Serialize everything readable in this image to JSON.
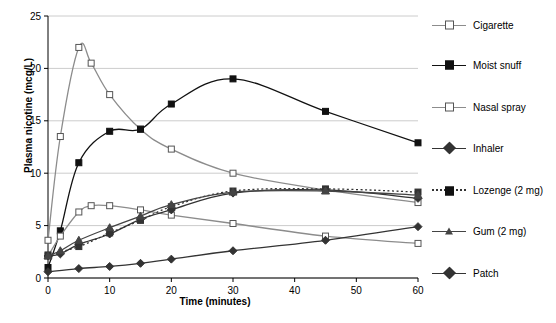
{
  "chart_data": {
    "type": "line",
    "title": "",
    "xlabel": "Time (minutes)",
    "ylabel": "Plasma nicotine (mcg/L)",
    "xlim": [
      0,
      60
    ],
    "ylim": [
      0,
      25
    ],
    "xticks": [
      0,
      10,
      20,
      30,
      40,
      50,
      60
    ],
    "yticks": [
      0,
      5,
      10,
      15,
      20,
      25
    ],
    "grid": true,
    "legend_position": "right",
    "series": [
      {
        "name": "Cigarette",
        "marker": "open-square",
        "color": "#8c8c8c",
        "x": [
          0,
          2,
          5,
          7,
          10,
          15,
          20,
          30,
          45,
          60
        ],
        "y": [
          3.6,
          13.5,
          22.0,
          20.5,
          17.5,
          14.2,
          12.3,
          10.0,
          8.4,
          7.2
        ]
      },
      {
        "name": "Moist snuff",
        "marker": "filled-square",
        "color": "#111111",
        "x": [
          0,
          2,
          5,
          10,
          15,
          20,
          30,
          45,
          60
        ],
        "y": [
          1.0,
          4.5,
          11.0,
          14.0,
          14.2,
          16.6,
          19.0,
          15.9,
          12.9
        ]
      },
      {
        "name": "Nasal spray",
        "marker": "open-square",
        "color": "#8c8c8c",
        "x": [
          0,
          2,
          5,
          7,
          10,
          15,
          20,
          30,
          45,
          60
        ],
        "y": [
          2.1,
          4.0,
          6.3,
          6.9,
          6.9,
          6.5,
          6.0,
          5.2,
          4.0,
          3.3
        ]
      },
      {
        "name": "Inhaler",
        "marker": "filled-diamond",
        "color": "#333333",
        "x": [
          0,
          2,
          5,
          10,
          15,
          20,
          30,
          45,
          60
        ],
        "y": [
          2.1,
          2.3,
          3.2,
          4.2,
          5.6,
          6.5,
          8.1,
          8.4,
          7.6
        ]
      },
      {
        "name": "Lozenge (2 mg)",
        "marker": "filled-square",
        "line_style": "dotted",
        "color": "#333333",
        "x": [
          0,
          5,
          10,
          15,
          20,
          30,
          45,
          60
        ],
        "y": [
          2.2,
          3.0,
          4.3,
          5.5,
          6.8,
          8.3,
          8.5,
          8.2
        ]
      },
      {
        "name": "Gum (2 mg)",
        "marker": "filled-triangle",
        "color": "#444444",
        "x": [
          0,
          2,
          5,
          10,
          15,
          20,
          30,
          45,
          60
        ],
        "y": [
          2.1,
          2.6,
          3.6,
          4.8,
          5.9,
          7.0,
          8.2,
          8.3,
          7.9
        ]
      },
      {
        "name": "Patch",
        "marker": "filled-diamond",
        "color": "#333333",
        "x": [
          0,
          5,
          10,
          15,
          20,
          30,
          45,
          60
        ],
        "y": [
          0.6,
          0.9,
          1.1,
          1.4,
          1.8,
          2.6,
          3.6,
          4.9
        ]
      }
    ]
  },
  "legend": {
    "items": [
      {
        "label": "Cigarette"
      },
      {
        "label": "Moist snuff"
      },
      {
        "label": "Nasal spray"
      },
      {
        "label": "Inhaler"
      },
      {
        "label": "Lozenge (2 mg)"
      },
      {
        "label": "Gum (2 mg)"
      },
      {
        "label": "Patch"
      }
    ]
  }
}
